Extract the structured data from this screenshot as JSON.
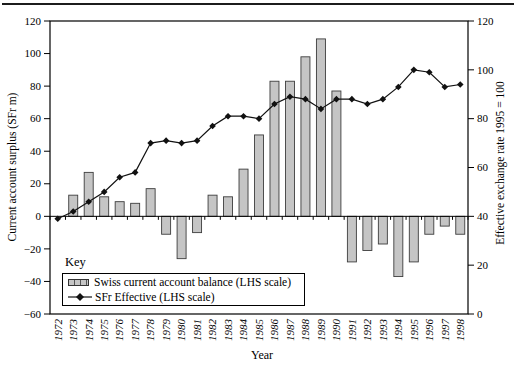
{
  "colors": {
    "background": "#ffffff",
    "bar_fill": "#c5c5c5",
    "bar_border": "#3d3d3d",
    "line": "#111111",
    "frame": "#000000"
  },
  "axes": {
    "left": {
      "title": "Current account surplus (SFr m)",
      "min": -60,
      "max": 120,
      "step": 20
    },
    "right": {
      "title": "Effective exchange rate 1995 = 100",
      "min": 0,
      "max": 120,
      "step": 20
    },
    "x": {
      "title": "Year"
    }
  },
  "legend": {
    "heading": "Key",
    "items": [
      {
        "label": "Swiss current account balance (LHS scale)",
        "marker": "bar-swatch"
      },
      {
        "label": "SFr Effective (LHS scale)",
        "marker": "line-diamond-swatch"
      }
    ]
  },
  "chart_data": {
    "type": "bar+line",
    "categories": [
      "1972",
      "1973",
      "1974",
      "1975",
      "1976",
      "1977",
      "1978",
      "1979",
      "1980",
      "1981",
      "1982",
      "1983",
      "1984",
      "1985",
      "1986",
      "1987",
      "1988",
      "1989",
      "1990",
      "1991",
      "1992",
      "1993",
      "1994",
      "1995",
      "1996",
      "1997",
      "1998"
    ],
    "series": [
      {
        "name": "Swiss current account balance (LHS scale)",
        "type": "bar",
        "axis": "left",
        "values": [
          0,
          13,
          27,
          12,
          9,
          8,
          17,
          -11,
          -26,
          -10,
          13,
          12,
          29,
          50,
          83,
          83,
          98,
          109,
          77,
          -28,
          -21,
          -17,
          -37,
          -28,
          -11,
          -6,
          -11
        ]
      },
      {
        "name": "SFr Effective (LHS scale)",
        "type": "line",
        "axis": "right",
        "values": [
          39,
          42,
          46,
          50,
          56,
          58,
          70,
          71,
          70,
          71,
          77,
          81,
          81,
          80,
          86,
          89,
          88,
          84,
          88,
          88,
          86,
          88,
          93,
          100,
          99,
          93,
          94
        ]
      }
    ],
    "title": "",
    "xlabel": "Year",
    "ylabel_left": "Current account surplus (SFr m)",
    "ylabel_right": "Effective exchange rate 1995 = 100",
    "left_ylim": [
      -60,
      120
    ],
    "right_ylim": [
      0,
      120
    ],
    "grid": false,
    "legend_position": "inside-bottom-left",
    "x_axis_crosses_at_left_value": 0
  }
}
